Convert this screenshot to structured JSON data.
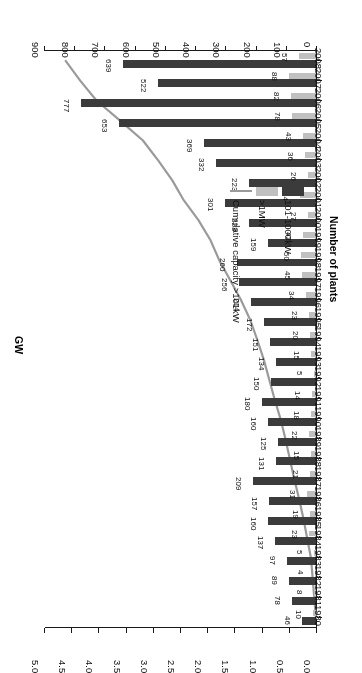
{
  "chart_data": {
    "type": "bar",
    "title": "",
    "subtitle": "",
    "xlabel": "Number of plants",
    "ylabel": "GW",
    "orientation": "horizontal-bar-rotated-180",
    "grid": false,
    "legend_position": "bottom-left",
    "categories": [
      "1980",
      "1981",
      "1982",
      "1983",
      "1984",
      "1985",
      "1986",
      "1987",
      "1988",
      "1989",
      "1990",
      "1991",
      "1992",
      "1993",
      "1994",
      "1995",
      "1996",
      "1997",
      "1998",
      "1999",
      "2000",
      "2001",
      "2002",
      "2003",
      "2004",
      "2005",
      "2006",
      "2007",
      "2008"
    ],
    "primary_axis": {
      "label": "Number of plants",
      "ticks": [
        0,
        100,
        200,
        300,
        400,
        500,
        600,
        700,
        800,
        900
      ],
      "lim": [
        0,
        900
      ]
    },
    "secondary_axis": {
      "label": "GW",
      "ticks": [
        "0.0",
        "0.5",
        "1.0",
        "1.5",
        "2.0",
        "2.5",
        "3.0",
        "3.5",
        "4.0",
        "4.5",
        "5.0"
      ],
      "lim": [
        0.0,
        5.0
      ]
    },
    "series": [
      {
        "name": "101-1000kW",
        "type": "bar",
        "color": "#3b3b3b",
        "axis": "primary",
        "values": [
          46,
          78,
          89,
          97,
          137,
          160,
          157,
          209,
          131,
          125,
          160,
          180,
          150,
          134,
          151,
          172,
          214,
          256,
          260,
          159,
          223,
          301,
          223,
          332,
          369,
          653,
          777,
          522,
          639
        ]
      },
      {
        "name": ">1MW",
        "type": "bar",
        "color": "#c0c0c0",
        "axis": "primary",
        "values": [
          10,
          8,
          4,
          5,
          23,
          19,
          31,
          21,
          15,
          22,
          18,
          14,
          5,
          15,
          20,
          23,
          34,
          45,
          50,
          42,
          27,
          54,
          26,
          36,
          43,
          78,
          82,
          88,
          57
        ]
      },
      {
        "name": "Cumulative capacity >101kW",
        "type": "line",
        "color": "#9a9a9a",
        "axis": "secondary",
        "unit": "GW",
        "values": [
          0.02,
          0.05,
          0.08,
          0.11,
          0.18,
          0.25,
          0.33,
          0.42,
          0.5,
          0.58,
          0.67,
          0.78,
          0.88,
          0.98,
          1.1,
          1.23,
          1.4,
          1.6,
          1.8,
          1.96,
          2.18,
          2.45,
          2.66,
          2.92,
          3.2,
          3.62,
          4.05,
          4.35,
          4.62
        ]
      }
    ]
  },
  "legend": {
    "items": [
      {
        "label": "101-1000kW",
        "marker": "dark-swatch"
      },
      {
        "label": ">1MW",
        "marker": "light-swatch"
      },
      {
        "label": "Cumulative capacity >101kW",
        "marker": "line"
      }
    ]
  },
  "axes": {
    "bottom_title": "Number of plants",
    "top_title": "GW",
    "bottom_ticks": [
      "0",
      "100",
      "200",
      "300",
      "400",
      "500",
      "600",
      "700",
      "800",
      "900"
    ],
    "top_ticks": [
      "0.0",
      "0.5",
      "1.0",
      "1.5",
      "2.0",
      "2.5",
      "3.0",
      "3.5",
      "4.0",
      "4.5",
      "5.0"
    ]
  }
}
